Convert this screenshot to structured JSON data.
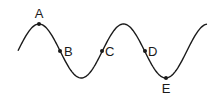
{
  "diagram": {
    "type": "wave",
    "stroke_color": "#1a1a1a",
    "background": "#ffffff",
    "points": [
      {
        "label": "A",
        "position": "crest"
      },
      {
        "label": "B",
        "position": "equilibrium, descending"
      },
      {
        "label": "C",
        "position": "equilibrium, ascending"
      },
      {
        "label": "D",
        "position": "equilibrium, descending"
      },
      {
        "label": "E",
        "position": "trough"
      }
    ]
  }
}
